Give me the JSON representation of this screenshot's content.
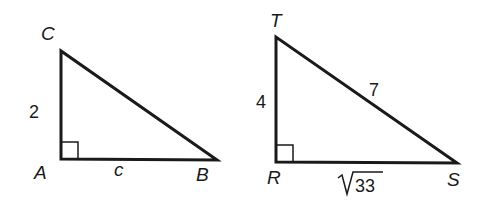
{
  "triangles": [
    {
      "name": "ABC",
      "vertices": {
        "C": "C",
        "A": "A",
        "B": "B"
      },
      "right_angle_at": "A",
      "sides": {
        "AC": "2",
        "AB": "c"
      }
    },
    {
      "name": "RST",
      "vertices": {
        "T": "T",
        "R": "R",
        "S": "S"
      },
      "right_angle_at": "R",
      "sides": {
        "RT": "4",
        "TS": "7",
        "RS_radicand": "33"
      }
    }
  ],
  "colors": {
    "stroke": "#1a1a1a",
    "background": "#ffffff"
  }
}
